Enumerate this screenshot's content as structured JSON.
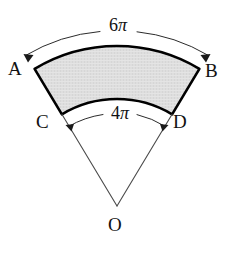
{
  "figure": {
    "kind": "annulus-sector-diagram",
    "background_color": "#ffffff",
    "band_fill_color": "#dedede",
    "outline_color": "#000000",
    "radial_line_color": "#4a4a4a",
    "label_color": "#111111"
  },
  "labels": {
    "point_a": "A",
    "point_b": "B",
    "point_c": "C",
    "point_d": "D",
    "point_o": "O"
  },
  "dimensions": {
    "outer_arc_label": "6π",
    "outer_arc_value": "6",
    "outer_arc_unit": "π",
    "inner_arc_label": "4π",
    "inner_arc_value": "4",
    "inner_arc_unit": "π"
  },
  "geometry": {
    "center_x": 117,
    "center_y": 206,
    "outer_radius": 160,
    "inner_radius": 107,
    "half_angle_deg": 31,
    "outer_arc_endpoints": {
      "a_x": 35,
      "a_y": 69,
      "b_x": 199,
      "b_y": 69
    },
    "inner_arc_endpoints": {
      "c_x": 62,
      "c_y": 115,
      "d_x": 172,
      "d_y": 115
    },
    "dimension_arc_outer_radius": 176,
    "dimension_arc_inner_radius": 96
  }
}
